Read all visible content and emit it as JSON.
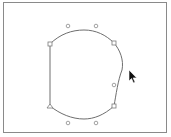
{
  "canvas": {
    "background": "#ffffff",
    "frame_color": "#8a8a8a",
    "stroke_color": "#6e6e6e"
  },
  "path": {
    "name": "closed-bezier-shape",
    "d": "M50,44 C60,34 72,30 84,30 C96,30 106,35 114,43 C120,50 124,60 122,70 C118,80 116,95 114,106 C104,115 94,119 84,119 C72,119 60,114 50,106 L50,44 Z"
  },
  "anchors": [
    {
      "id": "top-left",
      "x": 50,
      "y": 44,
      "shape": "square"
    },
    {
      "id": "top-right",
      "x": 114,
      "y": 43,
      "shape": "square"
    },
    {
      "id": "bottom-right",
      "x": 114,
      "y": 106,
      "shape": "square"
    },
    {
      "id": "bottom-left",
      "x": 50,
      "y": 106,
      "shape": "triangle"
    }
  ],
  "handles": [
    {
      "id": "top-handle-1",
      "x": 68,
      "y": 26
    },
    {
      "id": "top-handle-2",
      "x": 96,
      "y": 26
    },
    {
      "id": "right-handle",
      "x": 114,
      "y": 85
    },
    {
      "id": "bottom-handle-1",
      "x": 68,
      "y": 123
    },
    {
      "id": "bottom-handle-2",
      "x": 96,
      "y": 123
    }
  ],
  "cursor": {
    "icon": "arrow-pointer",
    "x": 129,
    "y": 70
  }
}
